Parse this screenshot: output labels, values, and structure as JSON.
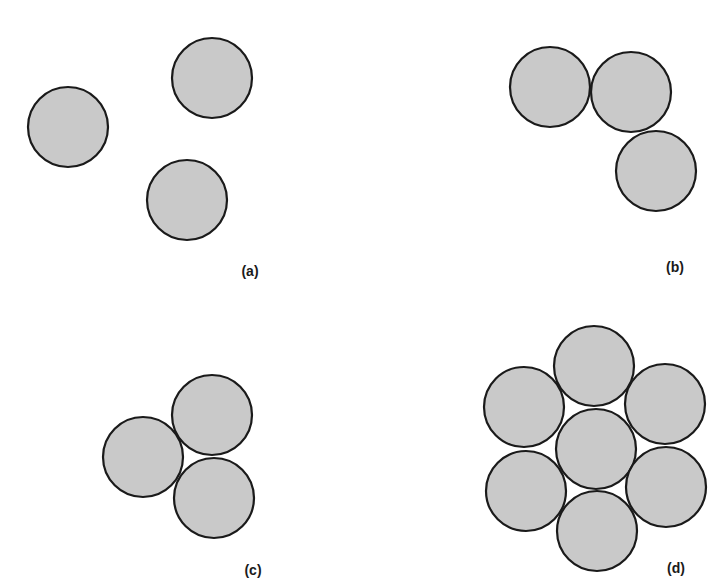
{
  "figure": {
    "panels": [
      {
        "id": "a",
        "label": "(a)",
        "label_pos": [
          250,
          276
        ],
        "radius": 40,
        "circles": [
          [
            68,
            127
          ],
          [
            212,
            78
          ],
          [
            187,
            200
          ]
        ]
      },
      {
        "id": "b",
        "label": "(b)",
        "label_pos": [
          675,
          272
        ],
        "radius": 40,
        "circles": [
          [
            550,
            87
          ],
          [
            631,
            92
          ],
          [
            656,
            171
          ]
        ]
      },
      {
        "id": "c",
        "label": "(c)",
        "label_pos": [
          253,
          575
        ],
        "radius": 40,
        "circles": [
          [
            143,
            457
          ],
          [
            212,
            415
          ],
          [
            214,
            498
          ]
        ]
      },
      {
        "id": "d",
        "label": "(d)",
        "label_pos": [
          676,
          573
        ],
        "radius": 40,
        "circles": [
          [
            594,
            366
          ],
          [
            524,
            407
          ],
          [
            665,
            404
          ],
          [
            596,
            449
          ],
          [
            526,
            491
          ],
          [
            666,
            487
          ],
          [
            597,
            531
          ]
        ]
      }
    ],
    "colors": {
      "fill": "#c9c9c9",
      "stroke": "#1a1a1a",
      "background": "#ffffff"
    }
  }
}
